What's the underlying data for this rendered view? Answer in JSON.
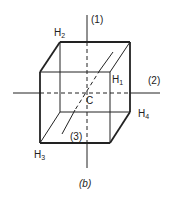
{
  "figure": {
    "caption": "(b)",
    "axes": [
      {
        "id": "1",
        "label": "(1)",
        "orientation": "vertical"
      },
      {
        "id": "2",
        "label": "(2)",
        "orientation": "horizontal"
      },
      {
        "id": "3",
        "label": "(3)",
        "orientation": "diagonal"
      }
    ],
    "center_label": "C",
    "vertices": [
      {
        "base": "H",
        "sub": "1"
      },
      {
        "base": "H",
        "sub": "2"
      },
      {
        "base": "H",
        "sub": "3"
      },
      {
        "base": "H",
        "sub": "4"
      }
    ],
    "colors": {
      "line": "#222222",
      "background": "#ffffff"
    }
  }
}
